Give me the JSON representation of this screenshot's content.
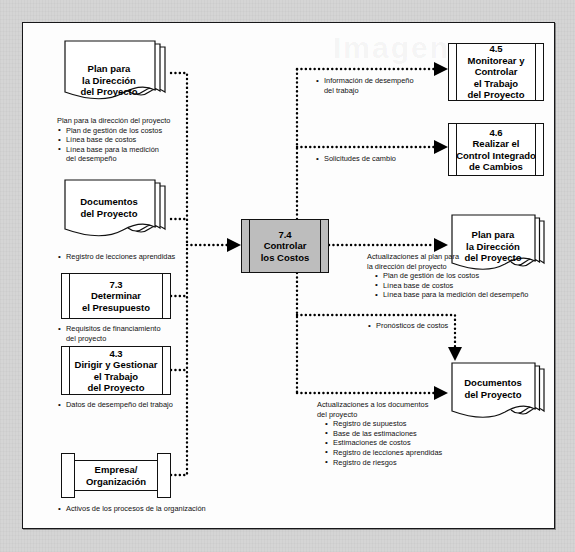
{
  "diagram": {
    "title_watermark": "Imagen",
    "center_process": {
      "label": "7.4\nControlar\nlos Costos"
    },
    "inputs": [
      {
        "id": "plan-direccion-proyecto",
        "shape": "document",
        "label": "Plan para\nla Dirección\ndel Proyecto",
        "annotation": {
          "header": "Plan para la dirección del proyecto",
          "items": [
            "Plan de gestión de los costos",
            "Línea base de costos",
            "Línea base para la medición\ndel desempeño"
          ]
        }
      },
      {
        "id": "documentos-proyecto-in",
        "shape": "document",
        "label": "Documentos\ndel Proyecto",
        "annotation": {
          "header": "",
          "items": [
            "Registro de lecciones aprendidas"
          ]
        }
      },
      {
        "id": "determinar-presupuesto",
        "shape": "process",
        "label": "7.3\nDeterminar\nel Presupuesto",
        "annotation": {
          "header": "",
          "items": [
            "Requisitos de financiamiento\ndel proyecto"
          ]
        }
      },
      {
        "id": "dirigir-gestionar-trabajo",
        "shape": "process",
        "label": "4.3\nDirigir y Gestionar\nel Trabajo\ndel Proyecto",
        "annotation": {
          "header": "",
          "items": [
            "Datos de desempeño del trabajo"
          ]
        }
      },
      {
        "id": "empresa-organizacion",
        "shape": "organization",
        "label": "Empresa/\nOrganización",
        "annotation": {
          "header": "",
          "items": [
            "Activos de los procesos de la organización"
          ]
        }
      }
    ],
    "outputs": [
      {
        "id": "monitorear-controlar-trabajo",
        "shape": "process",
        "label": "4.5\nMonitorear y\nControlar\nel Trabajo\ndel Proyecto",
        "annotation": {
          "header": "",
          "items": [
            "Información de desempeño\ndel trabajo"
          ]
        }
      },
      {
        "id": "control-integrado-cambios",
        "shape": "process",
        "label": "4.6\nRealizar el\nControl Integrado\nde Cambios",
        "annotation": {
          "header": "",
          "items": [
            "Solicitudes de cambio"
          ]
        }
      },
      {
        "id": "plan-direccion-proyecto-out",
        "shape": "document",
        "label": "Plan para\nla Dirección\ndel Proyecto",
        "annotation": {
          "header": "Actualizaciones al plan para\nla dirección del proyecto",
          "items": [
            "Plan de gestión de los costos",
            "Línea base de costos",
            "Línea base para la medición del desempeño"
          ]
        }
      },
      {
        "id": "pronosticos-costos",
        "shape": "none",
        "label": "",
        "annotation": {
          "header": "",
          "items": [
            "Pronósticos de costos"
          ]
        }
      },
      {
        "id": "documentos-proyecto-out",
        "shape": "document",
        "label": "Documentos\ndel Proyecto",
        "annotation": {
          "header": "Actualizaciones a los documentos\ndel proyecto",
          "items": [
            "Registro de supuestos",
            "Base de las estimaciones",
            "Estimaciones de costos",
            "Registro de lecciones aprendidas",
            "Registro de riesgos"
          ]
        }
      }
    ],
    "colors": {
      "page_background": "#d5d5d5",
      "panel_background": "#fdfdfd",
      "panel_border": "#18181a",
      "shape_stroke": "#111111",
      "center_process_fill": "#bdbdbd",
      "connector": "#000000"
    }
  }
}
